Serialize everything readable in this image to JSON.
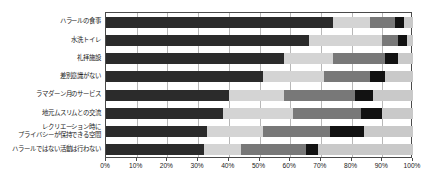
{
  "chart_data": {
    "type": "bar",
    "orientation": "horizontal",
    "stacked": true,
    "stacked_percent": true,
    "title": "",
    "xlabel": "",
    "ylabel": "",
    "xlim": [
      0,
      100
    ],
    "grid": true,
    "legend": "none",
    "xticks": [
      "0%",
      "10%",
      "20%",
      "30%",
      "40%",
      "50%",
      "60%",
      "70%",
      "80%",
      "90%",
      "100%"
    ],
    "xtick_values": [
      0,
      10,
      20,
      30,
      40,
      50,
      60,
      70,
      80,
      90,
      100
    ],
    "categories": [
      "ハラールの食事",
      "水洗トイレ",
      "礼拝施設",
      "差別意識がない",
      "ラマダーン月のサービス",
      "地元ムスリムとの交流",
      "レクリエーション時に\nプライバシーが保持できる空間",
      "ハラールではない活動は行わない"
    ],
    "series": [
      {
        "name": "series-1",
        "color": "#2b2b2b",
        "values": [
          74,
          66,
          58,
          51,
          40,
          38,
          33,
          32
        ]
      },
      {
        "name": "series-2",
        "color": "#d4d4d4",
        "values": [
          12,
          24,
          16,
          20,
          18,
          23,
          18,
          12
        ]
      },
      {
        "name": "series-3",
        "color": "#787878",
        "values": [
          8,
          5,
          17,
          15,
          23,
          22,
          22,
          21
        ]
      },
      {
        "name": "series-4",
        "color": "#121212",
        "values": [
          3,
          3,
          4,
          5,
          6,
          7,
          11,
          4
        ]
      },
      {
        "name": "series-5",
        "color": "#c9c9c9",
        "values": [
          3,
          2,
          5,
          9,
          13,
          10,
          16,
          31
        ]
      }
    ]
  },
  "colors": {
    "axis": "#4a4a4a",
    "grid": "#b8b8b8",
    "text": "#1a1a1a",
    "background": "#ffffff"
  }
}
